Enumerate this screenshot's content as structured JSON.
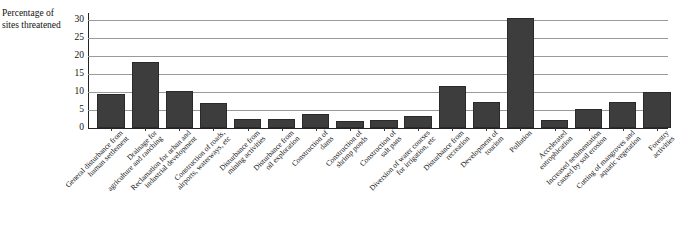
{
  "chart_data": {
    "type": "bar",
    "title": "",
    "subtitle": "",
    "xlabel": "",
    "ylabel": "Percentage of sites threatened",
    "ylabel_lines": [
      "Percentage",
      "of sites",
      "threatened"
    ],
    "ylim": [
      0,
      32
    ],
    "yticks": [
      0,
      5,
      10,
      15,
      20,
      25,
      30
    ],
    "ytick_labels": [
      "0",
      "5",
      "10",
      "15",
      "20",
      "25",
      "30"
    ],
    "grid": true,
    "legend": false,
    "legend_position": "none",
    "bar_color": "#3d3d3d",
    "gridline_color": "#9a9a9a",
    "axis_color": "#222222",
    "categories": [
      "General disturbance from human settlement",
      "Drainage for agriculture and ranching",
      "Reclamation for urban and industrial development",
      "Construction of roads, airports, waterways, etc",
      "Disturbance from mining activities",
      "Disturbance from oil exploration",
      "Construction of dams",
      "Construction of shrimp ponds",
      "Construction of salt pans",
      "Diversion of water courses for irrigation, etc",
      "Disturbance from recreation",
      "Development of tourism",
      "Pollution",
      "Accelerated eutrophication",
      "Increased sedimentation caused by soil erosion",
      "Cutting of mangroves and aquatic vegetation",
      "Forestry activities"
    ],
    "category_lines": [
      [
        "General disturbance from",
        "human settlement"
      ],
      [
        "Drainage for",
        "agriculture and ranching"
      ],
      [
        "Reclamation for urban and",
        "industrial development"
      ],
      [
        "Construction of roads,",
        "airports, waterways, etc"
      ],
      [
        "Disturbance from",
        "mining activities"
      ],
      [
        "Disturbance from",
        "oil exploration"
      ],
      [
        "Construction of",
        "dams"
      ],
      [
        "Construction of",
        "shrimp ponds"
      ],
      [
        "Construction of",
        "salt pans"
      ],
      [
        "Diversion of water courses",
        "for irrigation, etc"
      ],
      [
        "Disturbance from",
        "recreation"
      ],
      [
        "Development of",
        "tourism"
      ],
      [
        "Pollution"
      ],
      [
        "Accelerated",
        "eutrophication"
      ],
      [
        "Increased sedimentation",
        "caused by soil erosion"
      ],
      [
        "Cutting of mangroves and",
        "aquatic vegetation"
      ],
      [
        "Forestry",
        "activities"
      ]
    ],
    "values": [
      9.5,
      18.5,
      10.4,
      7.0,
      2.5,
      2.5,
      4.0,
      2.0,
      2.3,
      3.3,
      11.8,
      7.3,
      30.5,
      2.3,
      5.2,
      7.3,
      10.0
    ]
  }
}
